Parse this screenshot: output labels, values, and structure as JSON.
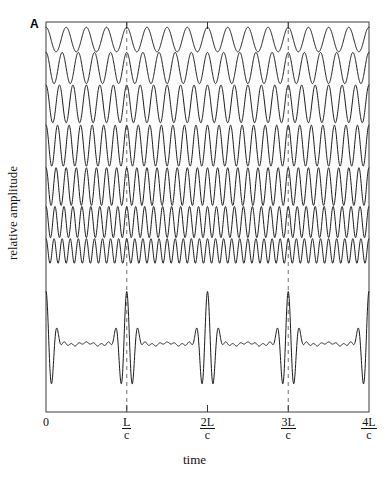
{
  "figure": {
    "panel_label": "A",
    "y_axis_label": "relative amplitude",
    "x_axis_label": "time"
  },
  "axis": {
    "ticks": [
      {
        "label": "0",
        "is_fraction": false,
        "numerator": "0",
        "denominator": "",
        "x_frac": 0.0,
        "dashed": false
      },
      {
        "label": "L/c",
        "is_fraction": true,
        "numerator": "L",
        "denominator": "c",
        "x_frac": 0.25,
        "dashed": true
      },
      {
        "label": "2L/c",
        "is_fraction": true,
        "numerator": "2L",
        "denominator": "c",
        "x_frac": 0.5,
        "dashed": false
      },
      {
        "label": "3L/c",
        "is_fraction": true,
        "numerator": "3L",
        "denominator": "c",
        "x_frac": 0.75,
        "dashed": true
      },
      {
        "label": "4L/c",
        "is_fraction": true,
        "numerator": "4L",
        "denominator": "c",
        "x_frac": 1.0,
        "dashed": false
      }
    ]
  },
  "style": {
    "trace_color": "#1a1a1a",
    "frame_color": "#3c3c3c",
    "dashed_color": "#7a7a7a",
    "background": "#ffffff",
    "line_width": 1.0
  },
  "chart_data": {
    "type": "line",
    "title": "",
    "xlabel": "time",
    "ylabel": "relative amplitude",
    "xlim": [
      0,
      4
    ],
    "xlim_units": "L/c",
    "ylim": [
      0,
      1
    ],
    "grid": false,
    "legend": "none",
    "annotations": [
      {
        "text": "A",
        "position": "top-left-outside"
      },
      {
        "text": "dashed vertical guide",
        "x": 1.0
      },
      {
        "text": "dashed vertical guide",
        "x": 3.0
      }
    ],
    "series": [
      {
        "name": "harmonic-1",
        "row": 0,
        "cycles_per_Lc": 4.0,
        "amplitude": 0.32,
        "baseline_y": 0.955,
        "row_height": 30
      },
      {
        "name": "harmonic-2",
        "row": 1,
        "cycles_per_Lc": 5.0,
        "amplitude": 0.62,
        "baseline_y": 0.882,
        "row_height": 38
      },
      {
        "name": "harmonic-3",
        "row": 2,
        "cycles_per_Lc": 6.0,
        "amplitude": 0.88,
        "baseline_y": 0.79,
        "row_height": 46
      },
      {
        "name": "harmonic-4",
        "row": 3,
        "cycles_per_Lc": 7.0,
        "amplitude": 1.0,
        "baseline_y": 0.683,
        "row_height": 50
      },
      {
        "name": "harmonic-5",
        "row": 4,
        "cycles_per_Lc": 8.0,
        "amplitude": 0.88,
        "baseline_y": 0.578,
        "row_height": 46
      },
      {
        "name": "harmonic-6",
        "row": 5,
        "cycles_per_Lc": 9.0,
        "amplitude": 0.62,
        "baseline_y": 0.487,
        "row_height": 38
      },
      {
        "name": "harmonic-7",
        "row": 6,
        "cycles_per_Lc": 10.0,
        "amplitude": 0.32,
        "baseline_y": 0.413,
        "row_height": 30
      },
      {
        "name": "composite-sum",
        "row": 7,
        "is_sum": true,
        "amplitude": 1.0,
        "baseline_y": 0.175,
        "row_height": 110
      }
    ]
  },
  "geometry": {
    "plot_left": 46,
    "plot_top": 22,
    "plot_right": 369,
    "plot_bottom": 412
  }
}
